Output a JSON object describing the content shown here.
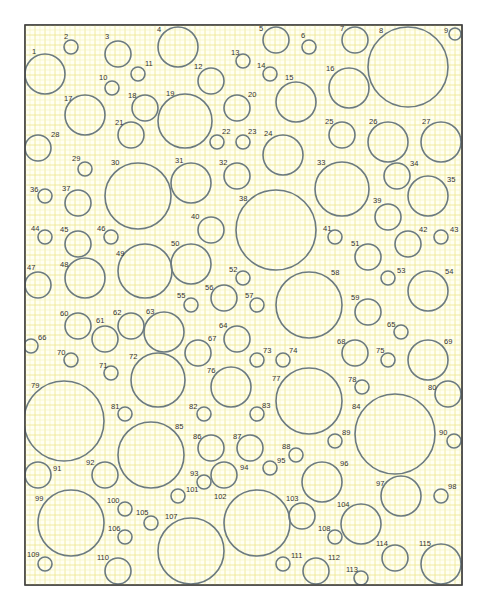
{
  "diagram": {
    "frame": {
      "x": 25,
      "y": 25,
      "width": 437,
      "height": 560
    },
    "grid": {
      "minor_step": 5,
      "major_step": 10,
      "minor_color": "#f3f0b8",
      "major_color": "#ece58e"
    },
    "stroke_color": "#6b7a80",
    "circles": [
      {
        "n": "1",
        "cx": 45,
        "cy": 74,
        "r": 20,
        "lx": 32,
        "ly": 54
      },
      {
        "n": "2",
        "cx": 71,
        "cy": 47,
        "r": 7,
        "lx": 64,
        "ly": 39
      },
      {
        "n": "3",
        "cx": 118,
        "cy": 54,
        "r": 13,
        "lx": 105,
        "ly": 39
      },
      {
        "n": "4",
        "cx": 178,
        "cy": 47,
        "r": 20,
        "lx": 157,
        "ly": 32
      },
      {
        "n": "5",
        "cx": 276,
        "cy": 40,
        "r": 13,
        "lx": 259,
        "ly": 31
      },
      {
        "n": "6",
        "cx": 309,
        "cy": 47,
        "r": 7,
        "lx": 301,
        "ly": 38
      },
      {
        "n": "7",
        "cx": 355,
        "cy": 40,
        "r": 13,
        "lx": 340,
        "ly": 31
      },
      {
        "n": "8",
        "cx": 408,
        "cy": 67,
        "r": 40,
        "lx": 379,
        "ly": 33
      },
      {
        "n": "9",
        "cx": 455,
        "cy": 34,
        "r": 6,
        "lx": 444,
        "ly": 33
      },
      {
        "n": "10",
        "cx": 112,
        "cy": 88,
        "r": 7,
        "lx": 99,
        "ly": 80
      },
      {
        "n": "11",
        "cx": 138,
        "cy": 74,
        "r": 7,
        "lx": 145,
        "ly": 66
      },
      {
        "n": "12",
        "cx": 211,
        "cy": 81,
        "r": 13,
        "lx": 194,
        "ly": 69
      },
      {
        "n": "13",
        "cx": 243,
        "cy": 61,
        "r": 7,
        "lx": 231,
        "ly": 55
      },
      {
        "n": "14",
        "cx": 270,
        "cy": 74,
        "r": 7,
        "lx": 257,
        "ly": 68
      },
      {
        "n": "15",
        "cx": 296,
        "cy": 102,
        "r": 20,
        "lx": 285,
        "ly": 80
      },
      {
        "n": "16",
        "cx": 349,
        "cy": 88,
        "r": 20,
        "lx": 326,
        "ly": 71
      },
      {
        "n": "17",
        "cx": 85,
        "cy": 115,
        "r": 20,
        "lx": 64,
        "ly": 101
      },
      {
        "n": "18",
        "cx": 145,
        "cy": 108,
        "r": 13,
        "lx": 128,
        "ly": 98
      },
      {
        "n": "19",
        "cx": 185,
        "cy": 121,
        "r": 27,
        "lx": 166,
        "ly": 96
      },
      {
        "n": "20",
        "cx": 237,
        "cy": 108,
        "r": 13,
        "lx": 248,
        "ly": 97
      },
      {
        "n": "21",
        "cx": 131,
        "cy": 135,
        "r": 13,
        "lx": 115,
        "ly": 125
      },
      {
        "n": "22",
        "cx": 217,
        "cy": 142,
        "r": 7,
        "lx": 222,
        "ly": 134
      },
      {
        "n": "23",
        "cx": 243,
        "cy": 142,
        "r": 7,
        "lx": 248,
        "ly": 134
      },
      {
        "n": "24",
        "cx": 283,
        "cy": 155,
        "r": 20,
        "lx": 264,
        "ly": 136
      },
      {
        "n": "25",
        "cx": 342,
        "cy": 135,
        "r": 13,
        "lx": 325,
        "ly": 124
      },
      {
        "n": "26",
        "cx": 388,
        "cy": 142,
        "r": 20,
        "lx": 369,
        "ly": 124
      },
      {
        "n": "27",
        "cx": 441,
        "cy": 142,
        "r": 20,
        "lx": 422,
        "ly": 124
      },
      {
        "n": "28",
        "cx": 38,
        "cy": 148,
        "r": 13,
        "lx": 51,
        "ly": 137
      },
      {
        "n": "29",
        "cx": 85,
        "cy": 169,
        "r": 7,
        "lx": 72,
        "ly": 161
      },
      {
        "n": "30",
        "cx": 138,
        "cy": 196,
        "r": 33,
        "lx": 111,
        "ly": 165
      },
      {
        "n": "31",
        "cx": 191,
        "cy": 183,
        "r": 20,
        "lx": 175,
        "ly": 163
      },
      {
        "n": "32",
        "cx": 237,
        "cy": 176,
        "r": 13,
        "lx": 219,
        "ly": 165
      },
      {
        "n": "33",
        "cx": 342,
        "cy": 189,
        "r": 27,
        "lx": 317,
        "ly": 165
      },
      {
        "n": "34",
        "cx": 397,
        "cy": 176,
        "r": 13,
        "lx": 410,
        "ly": 166
      },
      {
        "n": "35",
        "cx": 428,
        "cy": 196,
        "r": 20,
        "lx": 447,
        "ly": 182
      },
      {
        "n": "36",
        "cx": 45,
        "cy": 196,
        "r": 7,
        "lx": 30,
        "ly": 192
      },
      {
        "n": "37",
        "cx": 78,
        "cy": 203,
        "r": 13,
        "lx": 62,
        "ly": 191
      },
      {
        "n": "38",
        "cx": 276,
        "cy": 230,
        "r": 40,
        "lx": 239,
        "ly": 201
      },
      {
        "n": "39",
        "cx": 388,
        "cy": 217,
        "r": 13,
        "lx": 373,
        "ly": 203
      },
      {
        "n": "40",
        "cx": 211,
        "cy": 230,
        "r": 13,
        "lx": 191,
        "ly": 219
      },
      {
        "n": "41",
        "cx": 335,
        "cy": 237,
        "r": 7,
        "lx": 323,
        "ly": 231
      },
      {
        "n": "42",
        "cx": 408,
        "cy": 244,
        "r": 13,
        "lx": 419,
        "ly": 232
      },
      {
        "n": "43",
        "cx": 441,
        "cy": 237,
        "r": 7,
        "lx": 450,
        "ly": 232
      },
      {
        "n": "44",
        "cx": 45,
        "cy": 237,
        "r": 7,
        "lx": 31,
        "ly": 231
      },
      {
        "n": "45",
        "cx": 78,
        "cy": 244,
        "r": 13,
        "lx": 60,
        "ly": 232
      },
      {
        "n": "46",
        "cx": 111,
        "cy": 237,
        "r": 7,
        "lx": 97,
        "ly": 231
      },
      {
        "n": "47",
        "cx": 38,
        "cy": 285,
        "r": 13,
        "lx": 27,
        "ly": 270
      },
      {
        "n": "48",
        "cx": 85,
        "cy": 278,
        "r": 20,
        "lx": 60,
        "ly": 267
      },
      {
        "n": "49",
        "cx": 145,
        "cy": 271,
        "r": 27,
        "lx": 116,
        "ly": 256
      },
      {
        "n": "50",
        "cx": 191,
        "cy": 264,
        "r": 20,
        "lx": 171,
        "ly": 246
      },
      {
        "n": "51",
        "cx": 368,
        "cy": 257,
        "r": 13,
        "lx": 351,
        "ly": 246
      },
      {
        "n": "52",
        "cx": 243,
        "cy": 278,
        "r": 7,
        "lx": 229,
        "ly": 272
      },
      {
        "n": "53",
        "cx": 388,
        "cy": 278,
        "r": 7,
        "lx": 397,
        "ly": 273
      },
      {
        "n": "54",
        "cx": 428,
        "cy": 291,
        "r": 20,
        "lx": 445,
        "ly": 274
      },
      {
        "n": "55",
        "cx": 191,
        "cy": 305,
        "r": 7,
        "lx": 177,
        "ly": 298
      },
      {
        "n": "56",
        "cx": 224,
        "cy": 298,
        "r": 13,
        "lx": 205,
        "ly": 290
      },
      {
        "n": "57",
        "cx": 257,
        "cy": 305,
        "r": 7,
        "lx": 245,
        "ly": 298
      },
      {
        "n": "58",
        "cx": 309,
        "cy": 305,
        "r": 33,
        "lx": 331,
        "ly": 275
      },
      {
        "n": "59",
        "cx": 368,
        "cy": 312,
        "r": 13,
        "lx": 351,
        "ly": 300
      },
      {
        "n": "60",
        "cx": 78,
        "cy": 326,
        "r": 13,
        "lx": 60,
        "ly": 316
      },
      {
        "n": "61",
        "cx": 105,
        "cy": 339,
        "r": 13,
        "lx": 96,
        "ly": 323
      },
      {
        "n": "62",
        "cx": 131,
        "cy": 326,
        "r": 13,
        "lx": 113,
        "ly": 315
      },
      {
        "n": "63",
        "cx": 164,
        "cy": 332,
        "r": 20,
        "lx": 146,
        "ly": 314
      },
      {
        "n": "64",
        "cx": 237,
        "cy": 339,
        "r": 13,
        "lx": 219,
        "ly": 328
      },
      {
        "n": "65",
        "cx": 401,
        "cy": 332,
        "r": 7,
        "lx": 387,
        "ly": 327
      },
      {
        "n": "66",
        "cx": 31,
        "cy": 346,
        "r": 7,
        "lx": 38,
        "ly": 340
      },
      {
        "n": "67",
        "cx": 198,
        "cy": 353,
        "r": 13,
        "lx": 208,
        "ly": 341
      },
      {
        "n": "68",
        "cx": 355,
        "cy": 353,
        "r": 13,
        "lx": 337,
        "ly": 344
      },
      {
        "n": "69",
        "cx": 428,
        "cy": 360,
        "r": 20,
        "lx": 444,
        "ly": 344
      },
      {
        "n": "70",
        "cx": 71,
        "cy": 360,
        "r": 7,
        "lx": 57,
        "ly": 355
      },
      {
        "n": "71",
        "cx": 111,
        "cy": 373,
        "r": 7,
        "lx": 99,
        "ly": 368
      },
      {
        "n": "72",
        "cx": 158,
        "cy": 380,
        "r": 27,
        "lx": 129,
        "ly": 359
      },
      {
        "n": "73",
        "cx": 257,
        "cy": 360,
        "r": 7,
        "lx": 263,
        "ly": 353
      },
      {
        "n": "74",
        "cx": 283,
        "cy": 360,
        "r": 7,
        "lx": 289,
        "ly": 353
      },
      {
        "n": "75",
        "cx": 388,
        "cy": 360,
        "r": 7,
        "lx": 376,
        "ly": 353
      },
      {
        "n": "76",
        "cx": 231,
        "cy": 387,
        "r": 20,
        "lx": 207,
        "ly": 373
      },
      {
        "n": "77",
        "cx": 309,
        "cy": 401,
        "r": 33,
        "lx": 272,
        "ly": 381
      },
      {
        "n": "78",
        "cx": 362,
        "cy": 387,
        "r": 7,
        "lx": 348,
        "ly": 382
      },
      {
        "n": "79",
        "cx": 64,
        "cy": 421,
        "r": 40,
        "lx": 31,
        "ly": 388
      },
      {
        "n": "80",
        "cx": 448,
        "cy": 394,
        "r": 13,
        "lx": 428,
        "ly": 390
      },
      {
        "n": "81",
        "cx": 125,
        "cy": 414,
        "r": 7,
        "lx": 111,
        "ly": 409
      },
      {
        "n": "82",
        "cx": 204,
        "cy": 414,
        "r": 7,
        "lx": 189,
        "ly": 409
      },
      {
        "n": "83",
        "cx": 257,
        "cy": 414,
        "r": 7,
        "lx": 262,
        "ly": 408
      },
      {
        "n": "84",
        "cx": 395,
        "cy": 434,
        "r": 40,
        "lx": 352,
        "ly": 409
      },
      {
        "n": "85",
        "cx": 151,
        "cy": 455,
        "r": 33,
        "lx": 175,
        "ly": 429
      },
      {
        "n": "86",
        "cx": 211,
        "cy": 448,
        "r": 13,
        "lx": 193,
        "ly": 439
      },
      {
        "n": "87",
        "cx": 250,
        "cy": 448,
        "r": 13,
        "lx": 233,
        "ly": 439
      },
      {
        "n": "88",
        "cx": 296,
        "cy": 455,
        "r": 7,
        "lx": 282,
        "ly": 449
      },
      {
        "n": "89",
        "cx": 335,
        "cy": 441,
        "r": 7,
        "lx": 342,
        "ly": 435
      },
      {
        "n": "90",
        "cx": 454,
        "cy": 441,
        "r": 7,
        "lx": 439,
        "ly": 435
      },
      {
        "n": "91",
        "cx": 38,
        "cy": 475,
        "r": 13,
        "lx": 53,
        "ly": 471
      },
      {
        "n": "92",
        "cx": 105,
        "cy": 475,
        "r": 13,
        "lx": 86,
        "ly": 465
      },
      {
        "n": "93",
        "cx": 204,
        "cy": 482,
        "r": 7,
        "lx": 190,
        "ly": 476
      },
      {
        "n": "94",
        "cx": 224,
        "cy": 475,
        "r": 13,
        "lx": 240,
        "ly": 470
      },
      {
        "n": "95",
        "cx": 270,
        "cy": 468,
        "r": 7,
        "lx": 277,
        "ly": 463
      },
      {
        "n": "96",
        "cx": 322,
        "cy": 482,
        "r": 20,
        "lx": 340,
        "ly": 466
      },
      {
        "n": "97",
        "cx": 401,
        "cy": 496,
        "r": 20,
        "lx": 376,
        "ly": 486
      },
      {
        "n": "98",
        "cx": 441,
        "cy": 496,
        "r": 7,
        "lx": 448,
        "ly": 489
      },
      {
        "n": "99",
        "cx": 71,
        "cy": 523,
        "r": 33,
        "lx": 35,
        "ly": 501
      },
      {
        "n": "100",
        "cx": 125,
        "cy": 509,
        "r": 7,
        "lx": 107,
        "ly": 503
      },
      {
        "n": "101",
        "cx": 178,
        "cy": 496,
        "r": 7,
        "lx": 186,
        "ly": 492
      },
      {
        "n": "102",
        "cx": 257,
        "cy": 523,
        "r": 33,
        "lx": 214,
        "ly": 499
      },
      {
        "n": "103",
        "cx": 302,
        "cy": 516,
        "r": 13,
        "lx": 286,
        "ly": 501
      },
      {
        "n": "104",
        "cx": 361,
        "cy": 524,
        "r": 20,
        "lx": 337,
        "ly": 507
      },
      {
        "n": "105",
        "cx": 151,
        "cy": 523,
        "r": 7,
        "lx": 136,
        "ly": 515
      },
      {
        "n": "106",
        "cx": 125,
        "cy": 537,
        "r": 7,
        "lx": 108,
        "ly": 531
      },
      {
        "n": "107",
        "cx": 191,
        "cy": 551,
        "r": 33,
        "lx": 165,
        "ly": 519
      },
      {
        "n": "108",
        "cx": 335,
        "cy": 537,
        "r": 7,
        "lx": 318,
        "ly": 531
      },
      {
        "n": "109",
        "cx": 45,
        "cy": 564,
        "r": 7,
        "lx": 27,
        "ly": 557
      },
      {
        "n": "110",
        "cx": 118,
        "cy": 571,
        "r": 13,
        "lx": 97,
        "ly": 560
      },
      {
        "n": "111",
        "cx": 283,
        "cy": 564,
        "r": 7,
        "lx": 291,
        "ly": 558
      },
      {
        "n": "112",
        "cx": 316,
        "cy": 571,
        "r": 13,
        "lx": 328,
        "ly": 560
      },
      {
        "n": "113",
        "cx": 361,
        "cy": 578,
        "r": 7,
        "lx": 346,
        "ly": 572
      },
      {
        "n": "114",
        "cx": 395,
        "cy": 558,
        "r": 13,
        "lx": 376,
        "ly": 546
      },
      {
        "n": "115",
        "cx": 441,
        "cy": 564,
        "r": 20,
        "lx": 419,
        "ly": 546
      }
    ]
  }
}
